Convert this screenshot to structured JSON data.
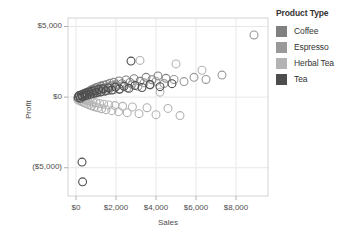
{
  "chart_data": {
    "type": "scatter",
    "title": "",
    "xlabel": "Sales",
    "ylabel": "Profit",
    "xlim": [
      -400,
      9600
    ],
    "ylim": [
      -7000,
      5600
    ],
    "xticks": [
      0,
      2000,
      4000,
      6000,
      8000
    ],
    "xtick_labels": [
      "$0",
      "$2,000",
      "$4,000",
      "$6,000",
      "$8,000"
    ],
    "yticks": [
      5000,
      0,
      -5000
    ],
    "ytick_labels": [
      "$5,000",
      "$0",
      "($5,000)"
    ],
    "grid": true,
    "grid_axis": "both",
    "legend_position": "right",
    "legend_title": "Product Type",
    "marker": "open-circle",
    "marker_size": 5.5,
    "series": [
      {
        "name": "Coffee",
        "color": "#808080",
        "points": [
          [
            120,
            60
          ],
          [
            180,
            90
          ],
          [
            210,
            30
          ],
          [
            260,
            140
          ],
          [
            300,
            80
          ],
          [
            340,
            190
          ],
          [
            380,
            120
          ],
          [
            420,
            240
          ],
          [
            460,
            60
          ],
          [
            500,
            300
          ],
          [
            540,
            160
          ],
          [
            580,
            350
          ],
          [
            620,
            210
          ],
          [
            660,
            420
          ],
          [
            700,
            270
          ],
          [
            740,
            480
          ],
          [
            780,
            330
          ],
          [
            820,
            540
          ],
          [
            860,
            380
          ],
          [
            900,
            600
          ],
          [
            950,
            430
          ],
          [
            1000,
            660
          ],
          [
            1060,
            490
          ],
          [
            1120,
            720
          ],
          [
            1180,
            560
          ],
          [
            1240,
            780
          ],
          [
            1300,
            610
          ],
          [
            1380,
            840
          ],
          [
            1460,
            670
          ],
          [
            1540,
            900
          ],
          [
            1620,
            730
          ],
          [
            1700,
            980
          ],
          [
            1800,
            800
          ],
          [
            1900,
            1060
          ],
          [
            2000,
            870
          ],
          [
            2150,
            1140
          ],
          [
            2300,
            950
          ],
          [
            2500,
            1220
          ],
          [
            2700,
            1040
          ],
          [
            2900,
            1300
          ],
          [
            3200,
            1120
          ],
          [
            3500,
            1400
          ],
          [
            3800,
            1230
          ],
          [
            4100,
            1500
          ],
          [
            4500,
            1330
          ]
        ]
      },
      {
        "name": "Espresso",
        "color": "#999999",
        "points": [
          [
            100,
            -60
          ],
          [
            150,
            20
          ],
          [
            200,
            -120
          ],
          [
            250,
            70
          ],
          [
            310,
            -40
          ],
          [
            370,
            130
          ],
          [
            430,
            10
          ],
          [
            490,
            190
          ],
          [
            550,
            70
          ],
          [
            610,
            250
          ],
          [
            670,
            120
          ],
          [
            730,
            310
          ],
          [
            790,
            180
          ],
          [
            850,
            370
          ],
          [
            910,
            230
          ],
          [
            980,
            430
          ],
          [
            1050,
            290
          ],
          [
            1130,
            490
          ],
          [
            1210,
            340
          ],
          [
            1300,
            550
          ],
          [
            1400,
            400
          ],
          [
            1500,
            620
          ],
          [
            1620,
            460
          ],
          [
            1750,
            690
          ],
          [
            1880,
            520
          ],
          [
            2020,
            760
          ],
          [
            2180,
            590
          ],
          [
            2350,
            830
          ],
          [
            2550,
            650
          ],
          [
            2800,
            910
          ],
          [
            3100,
            760
          ],
          [
            3400,
            1010
          ],
          [
            3700,
            860
          ],
          [
            4000,
            1110
          ],
          [
            4400,
            960
          ],
          [
            4900,
            1250
          ],
          [
            5400,
            1100
          ],
          [
            5900,
            1400
          ],
          [
            6500,
            1250
          ],
          [
            7300,
            1560
          ],
          [
            8900,
            4400
          ]
        ]
      },
      {
        "name": "Herbal Tea",
        "color": "#b3b3b3",
        "points": [
          [
            90,
            -180
          ],
          [
            140,
            -40
          ],
          [
            190,
            -260
          ],
          [
            240,
            -90
          ],
          [
            290,
            -330
          ],
          [
            350,
            -140
          ],
          [
            410,
            -400
          ],
          [
            470,
            -190
          ],
          [
            530,
            -470
          ],
          [
            590,
            -250
          ],
          [
            650,
            -540
          ],
          [
            710,
            -300
          ],
          [
            780,
            -610
          ],
          [
            850,
            -350
          ],
          [
            920,
            -680
          ],
          [
            1000,
            -400
          ],
          [
            1090,
            -750
          ],
          [
            1180,
            -450
          ],
          [
            1280,
            -820
          ],
          [
            1390,
            -500
          ],
          [
            1500,
            -890
          ],
          [
            1640,
            -550
          ],
          [
            1790,
            -960
          ],
          [
            1950,
            -600
          ],
          [
            2130,
            -1030
          ],
          [
            2330,
            -650
          ],
          [
            2560,
            -1100
          ],
          [
            2820,
            -700
          ],
          [
            3150,
            -1170
          ],
          [
            3550,
            -750
          ],
          [
            4000,
            -1240
          ],
          [
            4600,
            -800
          ],
          [
            5200,
            -1310
          ],
          [
            5000,
            2350
          ],
          [
            3200,
            2600
          ],
          [
            4200,
            350
          ],
          [
            6300,
            1900
          ]
        ]
      },
      {
        "name": "Tea",
        "color": "#4d4d4d",
        "points": [
          [
            110,
            -20
          ],
          [
            160,
            110
          ],
          [
            220,
            -80
          ],
          [
            280,
            170
          ],
          [
            330,
            40
          ],
          [
            390,
            230
          ],
          [
            450,
            100
          ],
          [
            510,
            290
          ],
          [
            570,
            150
          ],
          [
            640,
            350
          ],
          [
            710,
            210
          ],
          [
            780,
            410
          ],
          [
            860,
            260
          ],
          [
            940,
            470
          ],
          [
            1030,
            320
          ],
          [
            1130,
            530
          ],
          [
            1240,
            380
          ],
          [
            1360,
            590
          ],
          [
            1490,
            440
          ],
          [
            1630,
            650
          ],
          [
            1790,
            500
          ],
          [
            1970,
            710
          ],
          [
            2170,
            560
          ],
          [
            2400,
            770
          ],
          [
            2650,
            620
          ],
          [
            2950,
            830
          ],
          [
            3300,
            680
          ],
          [
            3700,
            890
          ],
          [
            4200,
            740
          ],
          [
            4800,
            950
          ],
          [
            2750,
            2550
          ],
          [
            300,
            -4600
          ],
          [
            330,
            -6000
          ]
        ]
      }
    ]
  }
}
